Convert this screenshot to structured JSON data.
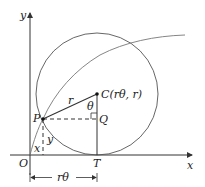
{
  "figure": {
    "axes": {
      "x_label": "x",
      "y_label": "y",
      "origin_label": "O"
    },
    "points": {
      "P": "P",
      "C": "C(rθ, r)",
      "Q": "Q",
      "T": "T"
    },
    "segments": {
      "radius_label": "r",
      "angle_label": "θ",
      "x_label": "x",
      "y_label": "y",
      "distance_label": "rθ"
    },
    "colors": {
      "lines": "#333333",
      "curve": "#666666",
      "circle": "#555555"
    }
  }
}
